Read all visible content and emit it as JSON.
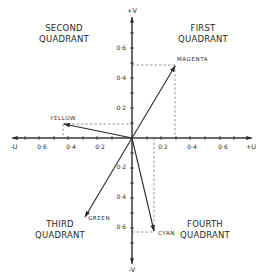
{
  "diagram": {
    "type": "vector-diagram",
    "quadrants": [
      {
        "name": "first",
        "line1": "FIRST",
        "line2": "QUADRANT"
      },
      {
        "name": "second",
        "line1": "SECOND",
        "line2": "QUADRANT"
      },
      {
        "name": "third",
        "line1": "THIRD",
        "line2": "QUADRANT"
      },
      {
        "name": "fourth",
        "line1": "FOURTH",
        "line2": "QUADRANT"
      }
    ],
    "axes": {
      "pos_u": "+U",
      "neg_u": "-U",
      "pos_v": "+V",
      "neg_v": "-V"
    },
    "u_ticks": [
      {
        "value": -0.6,
        "label": "0·6"
      },
      {
        "value": -0.4,
        "label": "0·4"
      },
      {
        "value": -0.2,
        "label": "0·2"
      },
      {
        "value": 0.2,
        "label": "0·2"
      },
      {
        "value": 0.4,
        "label": "0·4"
      },
      {
        "value": 0.6,
        "label": "0·6"
      }
    ],
    "v_ticks": [
      {
        "value": 0.6,
        "label": "0·6"
      },
      {
        "value": 0.4,
        "label": "0·4"
      },
      {
        "value": 0.2,
        "label": "0·2"
      },
      {
        "value": -0.2,
        "label": "0·2"
      },
      {
        "value": -0.4,
        "label": "0·4"
      },
      {
        "value": -0.6,
        "label": "0·6"
      }
    ],
    "vectors": [
      {
        "name": "magenta",
        "label": "MAGENTA",
        "u": 0.3,
        "v": 0.48
      },
      {
        "name": "yellow",
        "label": "YELLOW",
        "u": -0.45,
        "v": 0.1
      },
      {
        "name": "cyan",
        "label": "CYAN",
        "u": 0.15,
        "v": -0.62
      },
      {
        "name": "green",
        "label": "GREEN",
        "u": -0.3,
        "v": -0.55
      }
    ],
    "colors": {
      "ink": "#2a2a2a",
      "background": "#ffffff",
      "dashed": "#6a6a6a"
    }
  }
}
